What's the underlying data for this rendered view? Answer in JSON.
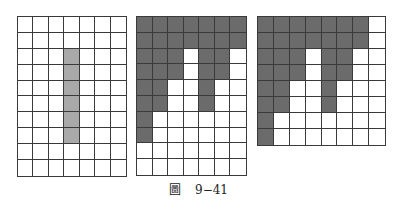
{
  "figure": {
    "caption_prefix": "圖",
    "caption_number": "9−41",
    "colors": {
      "line": "#3a3a3a",
      "light_fill": "#a9a9a9",
      "dark_fill": "#6b6b6b",
      "background": "#ffffff"
    },
    "grids": [
      {
        "id": "grid-1",
        "cols": 7,
        "rows": 10,
        "left": 17,
        "top": 16,
        "width": 110,
        "height": 161,
        "fill": "light",
        "pattern": [
          "0000000",
          "0000000",
          "0001000",
          "0001000",
          "0001000",
          "0001000",
          "0001000",
          "0001000",
          "0000000",
          "0000000"
        ]
      },
      {
        "id": "grid-2",
        "cols": 7,
        "rows": 10,
        "left": 136,
        "top": 16,
        "width": 111,
        "height": 160,
        "fill": "dark",
        "pattern": [
          "1111111",
          "1111111",
          "1110110",
          "1110110",
          "1100100",
          "1100100",
          "1000000",
          "1000000",
          "0000000",
          "0000000"
        ]
      },
      {
        "id": "grid-3",
        "cols": 8,
        "rows": 8,
        "left": 257,
        "top": 16,
        "width": 129,
        "height": 130,
        "fill": "dark",
        "pattern": [
          "11111110",
          "11111110",
          "11101100",
          "11101100",
          "11001000",
          "11001000",
          "10000000",
          "10000000"
        ]
      }
    ]
  }
}
